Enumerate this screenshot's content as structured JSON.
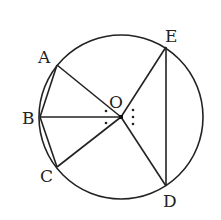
{
  "diagram": {
    "center": {
      "label": "O",
      "x": 121,
      "y": 117
    },
    "radius": 82,
    "points": [
      {
        "label": "A",
        "x": 57,
        "y": 65,
        "lx": 38,
        "ly": 63
      },
      {
        "label": "B",
        "x": 40,
        "y": 117,
        "lx": 22,
        "ly": 124
      },
      {
        "label": "C",
        "x": 57,
        "y": 167,
        "lx": 40,
        "ly": 182
      },
      {
        "label": "D",
        "x": 166,
        "y": 186,
        "lx": 163,
        "ly": 207
      },
      {
        "label": "E",
        "x": 166,
        "y": 47,
        "lx": 165,
        "ly": 42
      }
    ],
    "segments": [
      "AB",
      "BC",
      "OA",
      "OB",
      "OC",
      "OD",
      "OE",
      "ED"
    ],
    "angle_marks": {
      "left": ":",
      "right": "⋮"
    },
    "colors": {
      "stroke": "#222222",
      "background": "#ffffff"
    }
  }
}
